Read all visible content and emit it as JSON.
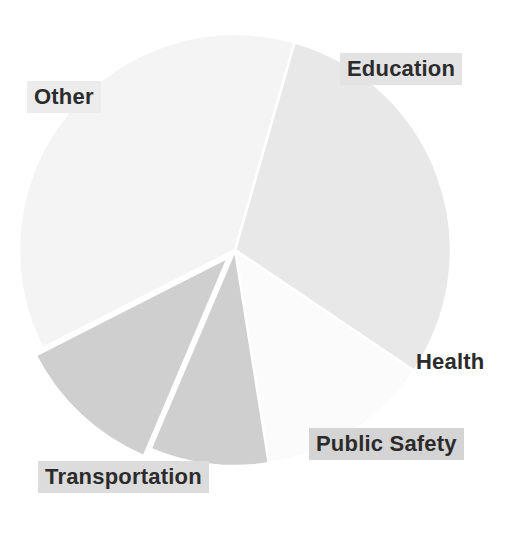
{
  "chart_data": {
    "type": "pie",
    "title": "",
    "subtitle": "",
    "xlabel": "",
    "ylabel": "",
    "legend_position": "none",
    "grid": false,
    "labels_on_slices": true,
    "categories": [
      "Education",
      "Health",
      "Public Safety",
      "Transportation",
      "Other"
    ],
    "values": [
      30,
      13,
      9,
      11,
      37
    ],
    "slices": [
      {
        "label": "Education",
        "value": 30,
        "percent": 30,
        "color": "#e8e8e8",
        "start_angle": -74,
        "end_angle": 34,
        "exploded": false,
        "label_x": 340,
        "label_y": 53,
        "label_bg": "#e3e3e3"
      },
      {
        "label": "Health",
        "value": 13,
        "percent": 13,
        "color": "#fbfbfb",
        "start_angle": 34,
        "end_angle": 81,
        "exploded": false,
        "label_x": 409,
        "label_y": 346,
        "label_bg": "transparent"
      },
      {
        "label": "Public Safety",
        "value": 9,
        "percent": 9,
        "color": "#cfcfcf",
        "start_angle": 81,
        "end_angle": 113,
        "exploded": false,
        "label_x": 309,
        "label_y": 428,
        "label_bg": "#d4d4d4"
      },
      {
        "label": "Transportation",
        "value": 11,
        "percent": 11,
        "color": "#cfcfcf",
        "start_angle": 113,
        "end_angle": 153,
        "exploded": true,
        "label_x": 38,
        "label_y": 461,
        "label_bg": "#dcdcdc"
      },
      {
        "label": "Other",
        "value": 37,
        "percent": 37,
        "color": "#f4f4f4",
        "start_angle": 153,
        "end_angle": 286,
        "exploded": false,
        "label_x": 27,
        "label_y": 81,
        "label_bg": "#ececec"
      }
    ],
    "geometry": {
      "center_x": 235,
      "center_y": 250,
      "radius": 216,
      "background": "#ffffff",
      "separator_color": "#ffffff"
    }
  },
  "labels": {
    "education": "Education",
    "health": "Health",
    "public_safety": "Public Safety",
    "transportation": "Transportation",
    "other": "Other"
  }
}
